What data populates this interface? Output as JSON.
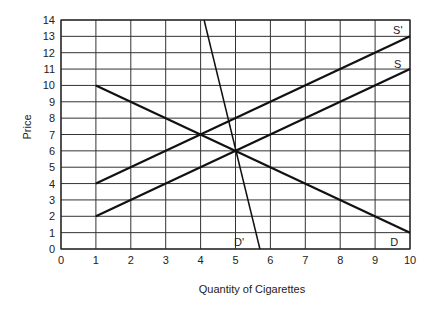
{
  "chart_data": {
    "type": "line",
    "title": "",
    "xlabel": "Quantity of Cigarettes",
    "ylabel": "Price",
    "xlim": [
      0,
      10
    ],
    "ylim": [
      0,
      14
    ],
    "x_ticks": [
      0,
      1,
      2,
      3,
      4,
      5,
      6,
      7,
      8,
      9,
      10
    ],
    "y_ticks": [
      0,
      1,
      2,
      3,
      4,
      5,
      6,
      7,
      8,
      9,
      10,
      11,
      12,
      13,
      14
    ],
    "grid": true,
    "legend": "none (curves labeled inline)",
    "series": [
      {
        "name": "S'",
        "points": [
          [
            1,
            4
          ],
          [
            10,
            13
          ]
        ],
        "label_pos": [
          9.65,
          13.4
        ],
        "style": "thick"
      },
      {
        "name": "S",
        "points": [
          [
            1,
            2
          ],
          [
            10,
            11
          ]
        ],
        "label_pos": [
          9.65,
          11.3
        ],
        "style": "thick"
      },
      {
        "name": "D",
        "points": [
          [
            1,
            10
          ],
          [
            10,
            1
          ]
        ],
        "label_pos": [
          9.55,
          0.45
        ],
        "style": "thick"
      },
      {
        "name": "D'",
        "points": [
          [
            4.1,
            14
          ],
          [
            5.7,
            0
          ]
        ],
        "label_pos": [
          5.1,
          0.45
        ],
        "style": "thin"
      }
    ],
    "annotations": [
      {
        "text": "S' and D intersect",
        "x": 4,
        "y": 7
      },
      {
        "text": "S, D and D' intersect",
        "x": 5,
        "y": 6
      }
    ]
  }
}
